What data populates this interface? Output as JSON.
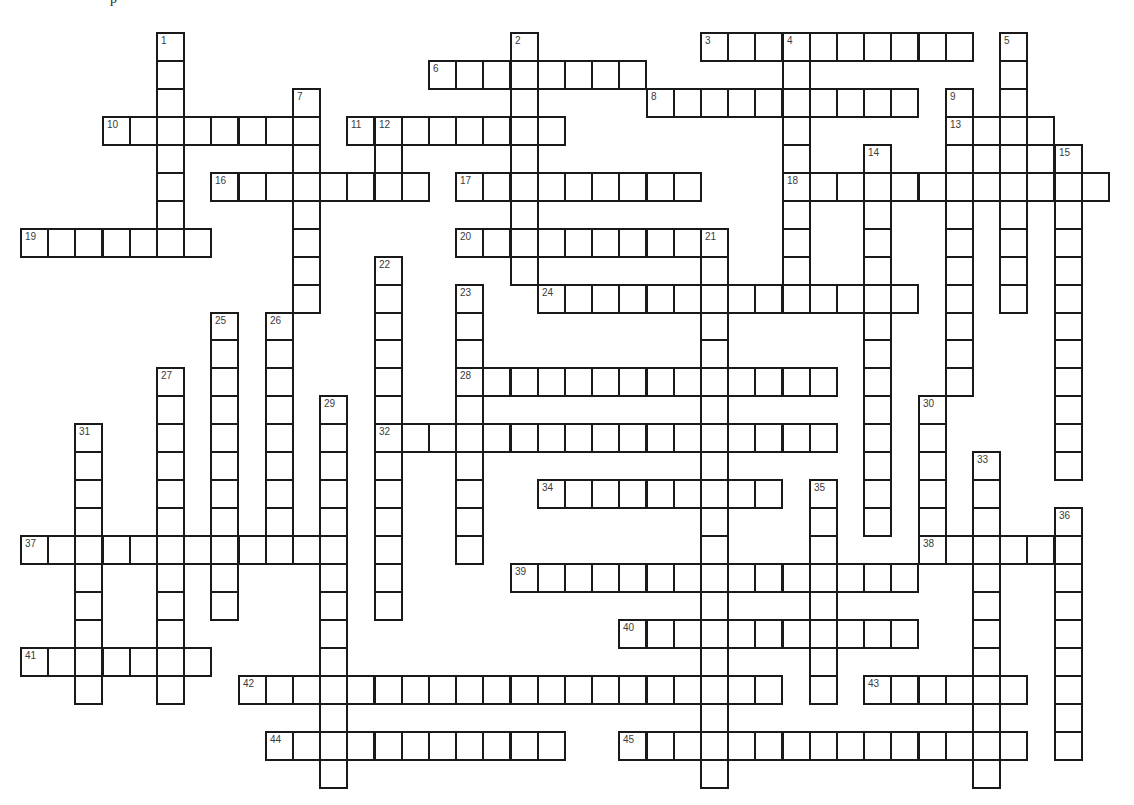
{
  "puzzle": {
    "type": "crossword",
    "top_fragment": "p",
    "grid_origin": {
      "x": 21,
      "y": 33
    },
    "cell_size": {
      "w": 27.2,
      "h": 27.95
    },
    "words": [
      {
        "number": 1,
        "direction": "down",
        "row": 0,
        "col": 5,
        "length": 8
      },
      {
        "number": 2,
        "direction": "down",
        "row": 0,
        "col": 18,
        "length": 9
      },
      {
        "number": 3,
        "direction": "across",
        "row": 0,
        "col": 25,
        "length": 10
      },
      {
        "number": 4,
        "direction": "down",
        "row": 0,
        "col": 28,
        "length": 10
      },
      {
        "number": 5,
        "direction": "down",
        "row": 0,
        "col": 36,
        "length": 10
      },
      {
        "number": 6,
        "direction": "across",
        "row": 1,
        "col": 15,
        "length": 8
      },
      {
        "number": 7,
        "direction": "down",
        "row": 2,
        "col": 10,
        "length": 8
      },
      {
        "number": 8,
        "direction": "across",
        "row": 2,
        "col": 23,
        "length": 10
      },
      {
        "number": 9,
        "direction": "down",
        "row": 2,
        "col": 34,
        "length": 11
      },
      {
        "number": 10,
        "direction": "across",
        "row": 3,
        "col": 3,
        "length": 8
      },
      {
        "number": 11,
        "direction": "across",
        "row": 3,
        "col": 12,
        "length": 8
      },
      {
        "number": 12,
        "direction": "down",
        "row": 3,
        "col": 13,
        "length": 3
      },
      {
        "number": 13,
        "direction": "across",
        "row": 3,
        "col": 34,
        "length": 4
      },
      {
        "number": 14,
        "direction": "down",
        "row": 4,
        "col": 31,
        "length": 14
      },
      {
        "number": 15,
        "direction": "down",
        "row": 4,
        "col": 38,
        "length": 12
      },
      {
        "number": 16,
        "direction": "across",
        "row": 5,
        "col": 7,
        "length": 8
      },
      {
        "number": 17,
        "direction": "across",
        "row": 5,
        "col": 16,
        "length": 9
      },
      {
        "number": 18,
        "direction": "across",
        "row": 5,
        "col": 28,
        "length": 12
      },
      {
        "number": 19,
        "direction": "across",
        "row": 7,
        "col": 0,
        "length": 7
      },
      {
        "number": 20,
        "direction": "across",
        "row": 7,
        "col": 16,
        "length": 10
      },
      {
        "number": 21,
        "direction": "down",
        "row": 7,
        "col": 25,
        "length": 20
      },
      {
        "number": 22,
        "direction": "down",
        "row": 8,
        "col": 13,
        "length": 13
      },
      {
        "number": 23,
        "direction": "down",
        "row": 9,
        "col": 16,
        "length": 10
      },
      {
        "number": 24,
        "direction": "across",
        "row": 9,
        "col": 19,
        "length": 14
      },
      {
        "number": 25,
        "direction": "down",
        "row": 10,
        "col": 7,
        "length": 11
      },
      {
        "number": 26,
        "direction": "down",
        "row": 10,
        "col": 9,
        "length": 9
      },
      {
        "number": 27,
        "direction": "down",
        "row": 12,
        "col": 5,
        "length": 12
      },
      {
        "number": 28,
        "direction": "across",
        "row": 12,
        "col": 16,
        "length": 14
      },
      {
        "number": 29,
        "direction": "down",
        "row": 13,
        "col": 11,
        "length": 14
      },
      {
        "number": 30,
        "direction": "down",
        "row": 13,
        "col": 33,
        "length": 6
      },
      {
        "number": 31,
        "direction": "down",
        "row": 14,
        "col": 2,
        "length": 10
      },
      {
        "number": 32,
        "direction": "across",
        "row": 14,
        "col": 13,
        "length": 17
      },
      {
        "number": 33,
        "direction": "down",
        "row": 15,
        "col": 35,
        "length": 12
      },
      {
        "number": 34,
        "direction": "across",
        "row": 16,
        "col": 19,
        "length": 9
      },
      {
        "number": 35,
        "direction": "down",
        "row": 16,
        "col": 29,
        "length": 8
      },
      {
        "number": 36,
        "direction": "down",
        "row": 17,
        "col": 38,
        "length": 9
      },
      {
        "number": 37,
        "direction": "across",
        "row": 18,
        "col": 0,
        "length": 12
      },
      {
        "number": 38,
        "direction": "across",
        "row": 18,
        "col": 33,
        "length": 6
      },
      {
        "number": 39,
        "direction": "across",
        "row": 19,
        "col": 18,
        "length": 15
      },
      {
        "number": 40,
        "direction": "across",
        "row": 21,
        "col": 22,
        "length": 11
      },
      {
        "number": 41,
        "direction": "across",
        "row": 22,
        "col": 0,
        "length": 7
      },
      {
        "number": 42,
        "direction": "across",
        "row": 23,
        "col": 8,
        "length": 20
      },
      {
        "number": 43,
        "direction": "across",
        "row": 23,
        "col": 31,
        "length": 6
      },
      {
        "number": 44,
        "direction": "across",
        "row": 25,
        "col": 9,
        "length": 11
      },
      {
        "number": 45,
        "direction": "across",
        "row": 25,
        "col": 22,
        "length": 15
      }
    ],
    "extra_cells": [
      {
        "row": 4,
        "col": 35
      },
      {
        "row": 4,
        "col": 37
      }
    ]
  }
}
